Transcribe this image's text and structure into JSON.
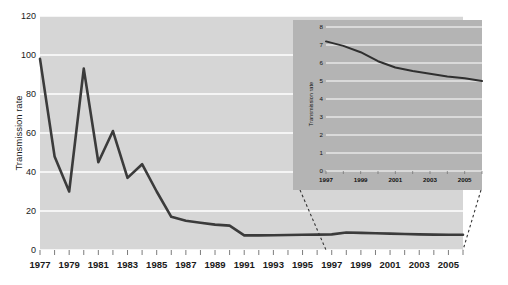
{
  "figure": {
    "name": "transmission-rate-figure",
    "background_color": "#ffffff"
  },
  "chart_data": [
    {
      "id": "main",
      "type": "line",
      "title": "",
      "xlabel": "",
      "ylabel": "Transmission rate",
      "xlim": [
        1977,
        2006
      ],
      "ylim": [
        0,
        120
      ],
      "yticks": [
        0,
        20,
        40,
        60,
        80,
        100,
        120
      ],
      "ytick_labels": [
        "0",
        "20",
        "40",
        "60",
        "80",
        "100",
        "120"
      ],
      "xticks": [
        1977,
        1979,
        1981,
        1983,
        1985,
        1987,
        1989,
        1991,
        1993,
        1995,
        1997,
        1999,
        2001,
        2003,
        2005
      ],
      "xtick_labels": [
        "1977",
        "1979",
        "1981",
        "1983",
        "1985",
        "1987",
        "1989",
        "1991",
        "1993",
        "1995",
        "1997",
        "1999",
        "2001",
        "2003",
        "2005"
      ],
      "minor_xtick_step": 1,
      "grid": "horizontal-white",
      "legend": "none",
      "plot_bgcolor": "#d6d6d6",
      "gridline_color": "#ffffff",
      "line_color": "#3b3b3b",
      "line_width": 2.6,
      "x": [
        1977,
        1978,
        1979,
        1980,
        1981,
        1982,
        1983,
        1984,
        1985,
        1986,
        1987,
        1988,
        1989,
        1990,
        1991,
        1992,
        1993,
        1994,
        1995,
        1996,
        1997,
        1998,
        1999,
        2000,
        2001,
        2002,
        2003,
        2004,
        2005,
        2006
      ],
      "values": [
        98,
        48,
        30,
        93,
        45,
        61,
        37,
        44,
        30,
        17,
        15,
        14,
        13,
        12.5,
        7.5,
        7.5,
        7.6,
        7.7,
        7.8,
        7.9,
        8.0,
        9.0,
        8.8,
        8.6,
        8.4,
        8.2,
        8.0,
        7.9,
        7.8,
        7.8
      ]
    },
    {
      "id": "inset",
      "type": "line",
      "title": "",
      "xlabel": "",
      "ylabel": "Transmission rate",
      "xlim": [
        1997,
        2006
      ],
      "ylim": [
        0,
        8
      ],
      "yticks": [
        0,
        1,
        2,
        3,
        4,
        5,
        6,
        7,
        8
      ],
      "ytick_labels": [
        "0",
        "1",
        "2",
        "3",
        "4",
        "5",
        "6",
        "7",
        "8"
      ],
      "xticks": [
        1997,
        1999,
        2001,
        2003,
        2005
      ],
      "xtick_labels": [
        "1997",
        "1999",
        "2001",
        "2003",
        "2005"
      ],
      "minor_xtick_step": 1,
      "grid": "horizontal-white",
      "legend": "none",
      "plot_bgcolor": "#b4b4b4",
      "gridline_color": "#ffffff",
      "line_color": "#2f2f2f",
      "line_width": 2.0,
      "x": [
        1997,
        1998,
        1999,
        2000,
        2001,
        2002,
        2003,
        2004,
        2005,
        2006
      ],
      "values": [
        7.2,
        6.95,
        6.6,
        6.1,
        5.75,
        5.55,
        5.4,
        5.25,
        5.15,
        5.0
      ]
    }
  ],
  "connectors": {
    "name": "inset-connector-lines",
    "style": "dashed",
    "color": "#333333"
  }
}
